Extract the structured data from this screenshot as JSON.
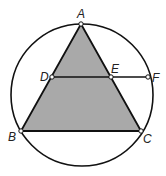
{
  "diagram": {
    "type": "geometry",
    "colors": {
      "stroke": "#111111",
      "fill": "#a9a9a9",
      "point_fill": "#ffffff"
    },
    "circle": {
      "cx": 82,
      "cy": 95,
      "r": 71
    },
    "points": {
      "A": {
        "label": "A",
        "x": 81,
        "y": 24
      },
      "B": {
        "label": "B",
        "x": 21,
        "y": 131
      },
      "C": {
        "label": "C",
        "x": 141,
        "y": 131
      },
      "D": {
        "label": "D",
        "x": 52,
        "y": 77
      },
      "E": {
        "label": "E",
        "x": 111,
        "y": 77
      },
      "F": {
        "label": "F",
        "x": 148,
        "y": 77
      }
    },
    "segments": [
      "AB",
      "AC",
      "BC",
      "DF"
    ],
    "shaded": "triangle ABC"
  }
}
